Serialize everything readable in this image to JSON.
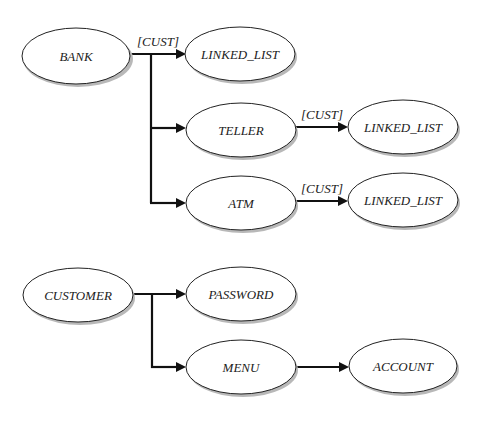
{
  "diagram": {
    "type": "class-association-diagram",
    "nodes": [
      {
        "id": "bank",
        "label": "BANK"
      },
      {
        "id": "linked_list_1",
        "label": "LINKED_LIST"
      },
      {
        "id": "teller",
        "label": "TELLER"
      },
      {
        "id": "linked_list_2",
        "label": "LINKED_LIST"
      },
      {
        "id": "atm",
        "label": "ATM"
      },
      {
        "id": "linked_list_3",
        "label": "LINKED_LIST"
      },
      {
        "id": "customer",
        "label": "CUSTOMER"
      },
      {
        "id": "password",
        "label": "PASSWORD"
      },
      {
        "id": "menu",
        "label": "MENU"
      },
      {
        "id": "account",
        "label": "ACCOUNT"
      }
    ],
    "edges": [
      {
        "from": "bank",
        "to": "linked_list_1",
        "label": "[CUST]"
      },
      {
        "from": "bank",
        "to": "teller",
        "label": ""
      },
      {
        "from": "bank",
        "to": "atm",
        "label": ""
      },
      {
        "from": "teller",
        "to": "linked_list_2",
        "label": "[CUST]"
      },
      {
        "from": "atm",
        "to": "linked_list_3",
        "label": "[CUST]"
      },
      {
        "from": "customer",
        "to": "password",
        "label": ""
      },
      {
        "from": "customer",
        "to": "menu",
        "label": ""
      },
      {
        "from": "menu",
        "to": "account",
        "label": ""
      }
    ]
  }
}
